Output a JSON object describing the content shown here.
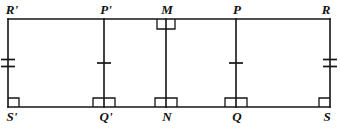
{
  "figure": {
    "stroke_color": "#141414",
    "background_color": "#ffffff",
    "stroke_width": 1.6,
    "rectangle": {
      "left": 8,
      "right": 330,
      "top": 19,
      "bottom": 107
    },
    "vertices": [
      {
        "id": "R-prime",
        "label": "R'",
        "x": 8,
        "y": 19,
        "position": "top-left",
        "side": "top"
      },
      {
        "id": "P-prime",
        "label": "P'",
        "x": 104,
        "y": 19,
        "position": "top-interior",
        "side": "top"
      },
      {
        "id": "M",
        "label": "M",
        "x": 166,
        "y": 19,
        "position": "top-midpoint",
        "side": "top"
      },
      {
        "id": "P",
        "label": "P",
        "x": 236,
        "y": 19,
        "position": "top-interior",
        "side": "top"
      },
      {
        "id": "R",
        "label": "R",
        "x": 330,
        "y": 19,
        "position": "top-right",
        "side": "top"
      },
      {
        "id": "S-prime",
        "label": "S'",
        "x": 8,
        "y": 107,
        "position": "bottom-left",
        "side": "bottom"
      },
      {
        "id": "Q-prime",
        "label": "Q'",
        "x": 104,
        "y": 107,
        "position": "bottom-interior",
        "side": "bottom"
      },
      {
        "id": "N",
        "label": "N",
        "x": 166,
        "y": 107,
        "position": "bottom-midpoint",
        "side": "bottom"
      },
      {
        "id": "Q",
        "label": "Q",
        "x": 236,
        "y": 107,
        "position": "bottom-interior",
        "side": "bottom"
      },
      {
        "id": "S",
        "label": "S",
        "x": 330,
        "y": 107,
        "position": "bottom-right",
        "side": "bottom"
      }
    ],
    "segments": [
      {
        "id": "top-edge",
        "name": "R'R",
        "x1": 8,
        "y1": 19,
        "x2": 330,
        "y2": 19
      },
      {
        "id": "bottom-edge",
        "name": "S'S",
        "x1": 8,
        "y1": 107,
        "x2": 330,
        "y2": 107
      },
      {
        "id": "left-edge",
        "name": "R'S'",
        "x1": 8,
        "y1": 19,
        "x2": 8,
        "y2": 107
      },
      {
        "id": "right-edge",
        "name": "RS",
        "x1": 330,
        "y1": 19,
        "x2": 330,
        "y2": 107
      },
      {
        "id": "seg-PQ-prime",
        "name": "P'Q'",
        "x1": 104,
        "y1": 19,
        "x2": 104,
        "y2": 107
      },
      {
        "id": "seg-MN",
        "name": "MN",
        "x1": 166,
        "y1": 19,
        "x2": 166,
        "y2": 107
      },
      {
        "id": "seg-PQ",
        "name": "PQ",
        "x1": 236,
        "y1": 19,
        "x2": 236,
        "y2": 107
      }
    ],
    "tick_marks": [
      {
        "id": "tick-left-edge",
        "on_segment": "R'S'",
        "x": 8,
        "y": 63,
        "count": 2,
        "note": "congruence double tick"
      },
      {
        "id": "tick-PQ-prime",
        "on_segment": "P'Q'",
        "x": 104,
        "y": 63,
        "count": 1,
        "note": "congruence single tick"
      },
      {
        "id": "tick-PQ",
        "on_segment": "PQ",
        "x": 236,
        "y": 63,
        "count": 1,
        "note": "congruence single tick"
      },
      {
        "id": "tick-right-edge",
        "on_segment": "RS",
        "x": 330,
        "y": 63,
        "count": 2,
        "note": "congruence double tick"
      }
    ],
    "right_angle_marks": [
      {
        "id": "ra-M",
        "at_vertex": "M",
        "x": 166,
        "y": 19,
        "style": "straddle-below",
        "width": 18,
        "height": 10
      },
      {
        "id": "ra-S-prime",
        "at_vertex": "S'",
        "x": 8,
        "y": 107,
        "style": "corner-upper-right",
        "width": 11,
        "height": 9
      },
      {
        "id": "ra-Q-prime",
        "at_vertex": "Q'",
        "x": 104,
        "y": 107,
        "style": "straddle-above",
        "width": 22,
        "height": 9
      },
      {
        "id": "ra-N",
        "at_vertex": "N",
        "x": 166,
        "y": 107,
        "style": "straddle-above",
        "width": 22,
        "height": 9
      },
      {
        "id": "ra-Q",
        "at_vertex": "Q",
        "x": 236,
        "y": 107,
        "style": "straddle-above",
        "width": 22,
        "height": 9
      },
      {
        "id": "ra-S",
        "at_vertex": "S",
        "x": 330,
        "y": 107,
        "style": "corner-upper-left",
        "width": 11,
        "height": 9
      }
    ]
  }
}
